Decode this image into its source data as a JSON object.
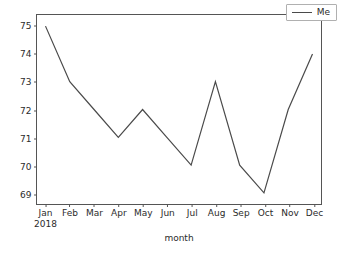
{
  "chart_data": {
    "type": "line",
    "title": "",
    "xlabel": "month",
    "ylabel": "",
    "x": [
      "Jan",
      "Feb",
      "Mar",
      "Apr",
      "May",
      "Jun",
      "Jul",
      "Aug",
      "Sep",
      "Oct",
      "Nov",
      "Dec"
    ],
    "x_sublabels": [
      "2018",
      "",
      "",
      "",
      "",
      "",
      "",
      "",
      "",
      "",
      "",
      ""
    ],
    "categories": [
      "Jan",
      "Feb",
      "Mar",
      "Apr",
      "May",
      "Jun",
      "Jul",
      "Aug",
      "Sep",
      "Oct",
      "Nov",
      "Dec"
    ],
    "series": [
      {
        "name": "Me",
        "values": [
          75,
          73,
          72,
          71,
          72,
          71,
          70,
          73,
          70,
          69,
          72,
          74
        ],
        "color": "#4a4a4a"
      }
    ],
    "ylim": [
      68.6,
      75.4
    ],
    "yticks": [
      69,
      70,
      71,
      72,
      73,
      74,
      75
    ],
    "ytick_labels": [
      "69",
      "70",
      "71",
      "72",
      "73",
      "74",
      "75"
    ],
    "xlim": [
      -0.35,
      11.35
    ],
    "grid": false,
    "legend": {
      "position": "upper right",
      "entries": [
        "Me"
      ]
    },
    "frame_color": "#555555",
    "background": "#ffffff"
  },
  "figure": {
    "x_axis_title": "month"
  }
}
